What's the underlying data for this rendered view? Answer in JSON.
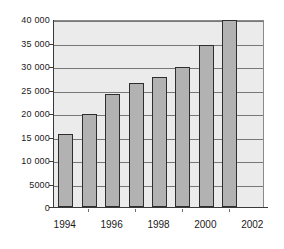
{
  "chart_data": {
    "type": "bar",
    "title": "",
    "subtitle": "",
    "xlabel": "",
    "ylabel": "",
    "categories": [
      "1994",
      "1995",
      "1996",
      "1997",
      "1998",
      "1999",
      "2000",
      "2001"
    ],
    "values": [
      15500,
      19800,
      24000,
      26400,
      27700,
      29800,
      34500,
      39700
    ],
    "series": [
      {
        "name": "",
        "values": [
          15500,
          19800,
          24000,
          26400,
          27700,
          29800,
          34500,
          39700
        ]
      }
    ],
    "ylim": [
      0,
      40000
    ],
    "xlim": [
      "1993.5",
      "2002.5"
    ],
    "y_ticks": [
      0,
      5000,
      10000,
      15000,
      20000,
      25000,
      30000,
      35000,
      40000
    ],
    "y_tick_labels": [
      "0",
      "5000",
      "10 000",
      "15 000",
      "20 000",
      "25 000",
      "30 000",
      "35 000",
      "40 000"
    ],
    "x_tick_labels": [
      "1994",
      "1996",
      "1998",
      "2000",
      "2002"
    ],
    "x_minor_ticks": [
      "1995",
      "1997",
      "1999",
      "2001"
    ],
    "grid": true,
    "grid_axis": "y",
    "legend": false,
    "legend_position": "none",
    "colors": {
      "bar_fill": "#b2b2b2",
      "bar_border": "#2e2e2e",
      "plot_background": "#ebebeb",
      "gridline": "#787878",
      "axis": "#3a3a3a",
      "text": "#1a1a1a",
      "page_background": "#ffffff"
    }
  }
}
